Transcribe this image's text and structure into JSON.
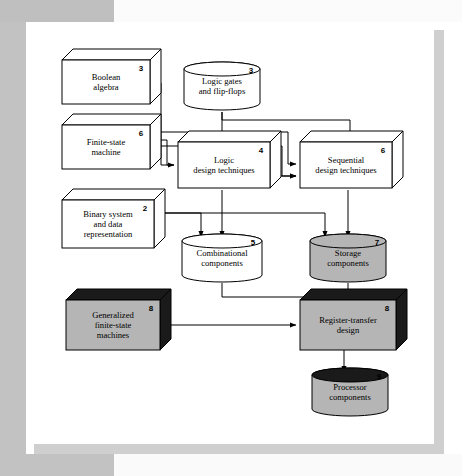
{
  "figure": {
    "background_color": "#ffffff",
    "frame_color": "#c2c2c2"
  },
  "palette": {
    "white": "#ffffff",
    "gray_fill": "#b5b5b5",
    "dark_fill": "#1a1a1a",
    "line": "#000000"
  },
  "nodes": [
    {
      "id": "boolean-algebra",
      "shape": "box3d",
      "label_lines": [
        "Boolean",
        "algebra"
      ],
      "chapter": "3",
      "style": "white",
      "x": 62,
      "y": 60,
      "w": 88,
      "h": 44
    },
    {
      "id": "logic-gates-flipflops",
      "shape": "cylinder",
      "label_lines": [
        "Logic gates",
        "and flip-flops"
      ],
      "chapter": "3",
      "style": "white",
      "x": 184,
      "y": 62,
      "w": 76,
      "h": 48
    },
    {
      "id": "finite-state-machine",
      "shape": "box3d",
      "label_lines": [
        "Finite-state",
        "machine"
      ],
      "chapter": "6",
      "style": "white",
      "x": 62,
      "y": 125,
      "w": 88,
      "h": 44
    },
    {
      "id": "logic-design-techniques",
      "shape": "box3d",
      "label_lines": [
        "Logic",
        "design techniques"
      ],
      "chapter": "4",
      "style": "white",
      "x": 178,
      "y": 142,
      "w": 92,
      "h": 46
    },
    {
      "id": "sequential-design-techniques",
      "shape": "box3d",
      "label_lines": [
        "Sequential",
        "design techniques"
      ],
      "chapter": "6",
      "style": "white",
      "x": 300,
      "y": 142,
      "w": 92,
      "h": 46
    },
    {
      "id": "binary-system-data-representation",
      "shape": "box3d",
      "label_lines": [
        "Binary system",
        "and data",
        "representation"
      ],
      "chapter": "2",
      "style": "white",
      "x": 62,
      "y": 200,
      "w": 92,
      "h": 48
    },
    {
      "id": "combinational-components",
      "shape": "cylinder",
      "label_lines": [
        "Combinational",
        "components"
      ],
      "chapter": "5",
      "style": "white",
      "x": 182,
      "y": 234,
      "w": 80,
      "h": 48
    },
    {
      "id": "storage-components",
      "shape": "cylinder",
      "label_lines": [
        "Storage",
        "components"
      ],
      "chapter": "7",
      "style": "gray",
      "x": 310,
      "y": 234,
      "w": 76,
      "h": 48
    },
    {
      "id": "generalized-finite-state-machines",
      "shape": "box3d",
      "label_lines": [
        "Generalized",
        "finite-state",
        "machines"
      ],
      "chapter": "8",
      "style": "dark",
      "x": 66,
      "y": 300,
      "w": 94,
      "h": 50
    },
    {
      "id": "register-transfer-design",
      "shape": "box3d",
      "label_lines": [
        "Register-transfer",
        "design"
      ],
      "chapter": "8",
      "style": "dark",
      "x": 300,
      "y": 300,
      "w": 96,
      "h": 50
    },
    {
      "id": "processor-components",
      "shape": "cylinder",
      "label_lines": [
        "Processor",
        "components"
      ],
      "chapter": "9",
      "style": "dark-top-gray",
      "x": 312,
      "y": 368,
      "w": 76,
      "h": 48
    }
  ],
  "edges": [
    {
      "from": "boolean-algebra",
      "to": "logic-design-techniques"
    },
    {
      "from": "logic-gates-flipflops",
      "to": "logic-design-techniques"
    },
    {
      "from": "logic-gates-flipflops",
      "to": "sequential-design-techniques"
    },
    {
      "from": "finite-state-machine",
      "to": "logic-design-techniques"
    },
    {
      "from": "finite-state-machine",
      "to": "sequential-design-techniques"
    },
    {
      "from": "logic-design-techniques",
      "to": "sequential-design-techniques"
    },
    {
      "from": "logic-design-techniques",
      "to": "combinational-components"
    },
    {
      "from": "binary-system-data-representation",
      "to": "combinational-components"
    },
    {
      "from": "binary-system-data-representation",
      "to": "storage-components"
    },
    {
      "from": "sequential-design-techniques",
      "to": "storage-components"
    },
    {
      "from": "combinational-components",
      "to": "register-transfer-design"
    },
    {
      "from": "storage-components",
      "to": "register-transfer-design"
    },
    {
      "from": "generalized-finite-state-machines",
      "to": "register-transfer-design"
    },
    {
      "from": "register-transfer-design",
      "to": "processor-components"
    }
  ]
}
